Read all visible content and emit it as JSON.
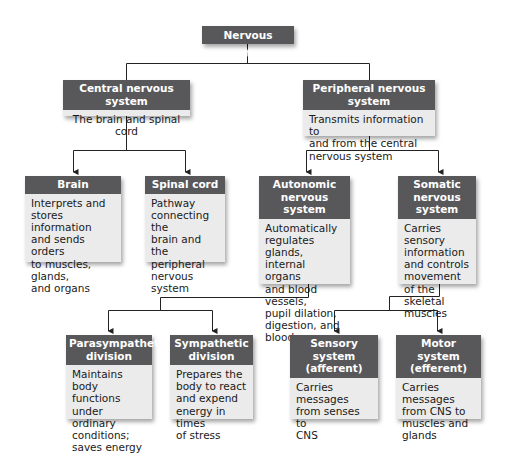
{
  "diagram": {
    "root": {
      "title": "Nervous system"
    },
    "cns": {
      "title": "Central nervous system",
      "desc": "The brain and spinal cord"
    },
    "pns": {
      "title": "Peripheral nervous system",
      "desc": "Transmits information to\nand from the central\nnervous system"
    },
    "brain": {
      "title": "Brain",
      "desc": "Interprets and\nstores information\nand sends orders\nto muscles, glands,\nand organs"
    },
    "spinal": {
      "title": "Spinal cord",
      "desc": "Pathway\nconnecting the\nbrain and the\nperipheral\nnervous system"
    },
    "autonomic": {
      "title": "Autonomic\nnervous system",
      "desc": "Automatically\nregulates glands,\ninternal organs\nand blood vessels,\npupil dilation,\ndigestion, and\nblood pressure"
    },
    "somatic": {
      "title": "Somatic\nnervous system",
      "desc": "Carries sensory\ninformation\nand controls\nmovement\nof the skeletal\nmuscles"
    },
    "parasympathetic": {
      "title": "Parasympathetic\ndivision",
      "desc": "Maintains body\nfunctions under\nordinary\nconditions;\nsaves energy"
    },
    "sympathetic": {
      "title": "Sympathetic\ndivision",
      "desc": "Prepares the\nbody to react\nand expend\nenergy in times\nof stress"
    },
    "sensory": {
      "title": "Sensory system\n(afferent)",
      "desc": "Carries messages\nfrom senses to\nCNS"
    },
    "motor": {
      "title": "Motor system\n(efferent)",
      "desc": "Carries messages\nfrom CNS to\nmuscles and\nglands"
    }
  },
  "colors": {
    "header": "#58585b",
    "body": "#ebebeb",
    "line": "#222222"
  }
}
